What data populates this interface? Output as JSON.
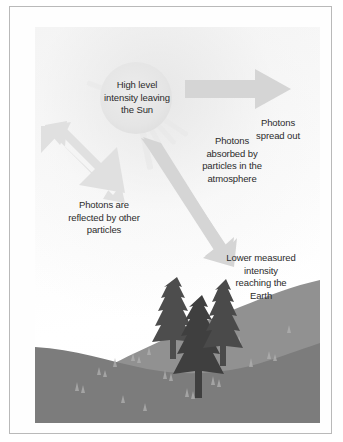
{
  "figure": {
    "type": "illustration"
  },
  "illustration": {
    "sun": {
      "name": "sun",
      "label": "High level\nintensity leaving\nthe Sun"
    },
    "arrows": [
      {
        "name": "arrow-spread-out",
        "direction": "right",
        "color": "#d5d5d5"
      },
      {
        "name": "arrow-reflected",
        "direction": "up-left",
        "color": "#dcdcdc"
      },
      {
        "name": "arrow-to-earth",
        "direction": "down-right",
        "color": "#d2d2d2"
      }
    ],
    "labels": {
      "spread_out": "Photons\nspread out",
      "absorbed": "Photons\nabsorbed by\nparticles in the\natmosphere",
      "reflected": "Photons are\nreflected by other\nparticles",
      "lower_intensity": "Lower measured\nintensity\nreaching the\nEarth"
    },
    "scenery": {
      "hill_far_color": "#8f8f8f",
      "hill_near_color": "#7e7e7e",
      "tree_color": "#4a4a4a",
      "tree_count": 3,
      "grass_color": "#b4b4b4"
    },
    "colors": {
      "sky": "#fbfbfb",
      "sun": "#e5e5e5",
      "arrow": "#d5d5d5",
      "text": "#2b2b2b",
      "frame_border": "#b9b9b9"
    }
  }
}
